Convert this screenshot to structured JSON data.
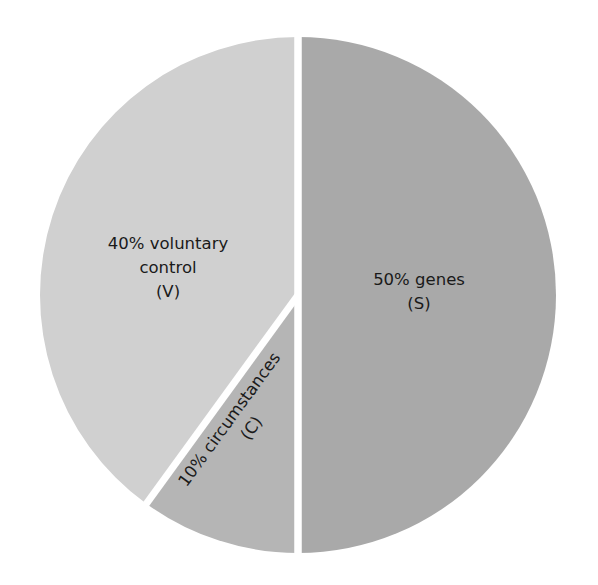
{
  "chart_data": {
    "type": "pie",
    "title": "",
    "slices": [
      {
        "key": "S",
        "label": "50% genes",
        "line1": "50% genes",
        "line2": "(S)",
        "value": 50,
        "color": "#a9a9a9"
      },
      {
        "key": "C",
        "label": "10% circumstances",
        "line1": "10% circumstances",
        "line2": "(C)",
        "value": 10,
        "color": "#b5b5b5"
      },
      {
        "key": "V",
        "label": "40% voluntary control",
        "line1": "40% voluntary",
        "line2": "control",
        "line3": "(V)",
        "value": 40,
        "color": "#d0d0d0"
      }
    ],
    "categories": [
      "genes (S)",
      "circumstances (C)",
      "voluntary control (V)"
    ],
    "values": [
      50,
      10,
      40
    ],
    "start_angle": "12 o'clock, clockwise",
    "legend": "none (inline labels)",
    "separator_color": "#ffffff"
  }
}
